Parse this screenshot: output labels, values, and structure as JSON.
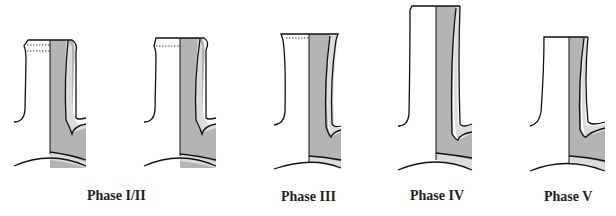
{
  "figure": {
    "colors": {
      "dark_fill": "#b4b4b4",
      "light_fill": "#dcdcdc",
      "stroke": "#111111",
      "background": "#ffffff"
    },
    "labels": [
      {
        "id": "phase-1-2",
        "text": "Phase I/II"
      },
      {
        "id": "phase-3",
        "text": "Phase III"
      },
      {
        "id": "phase-4",
        "text": "Phase IV"
      },
      {
        "id": "phase-5",
        "text": "Phase V"
      }
    ],
    "profiles": [
      {
        "phase": "Phase I/II",
        "variant": "a"
      },
      {
        "phase": "Phase I/II",
        "variant": "b"
      },
      {
        "phase": "Phase III"
      },
      {
        "phase": "Phase IV"
      },
      {
        "phase": "Phase V"
      }
    ]
  }
}
